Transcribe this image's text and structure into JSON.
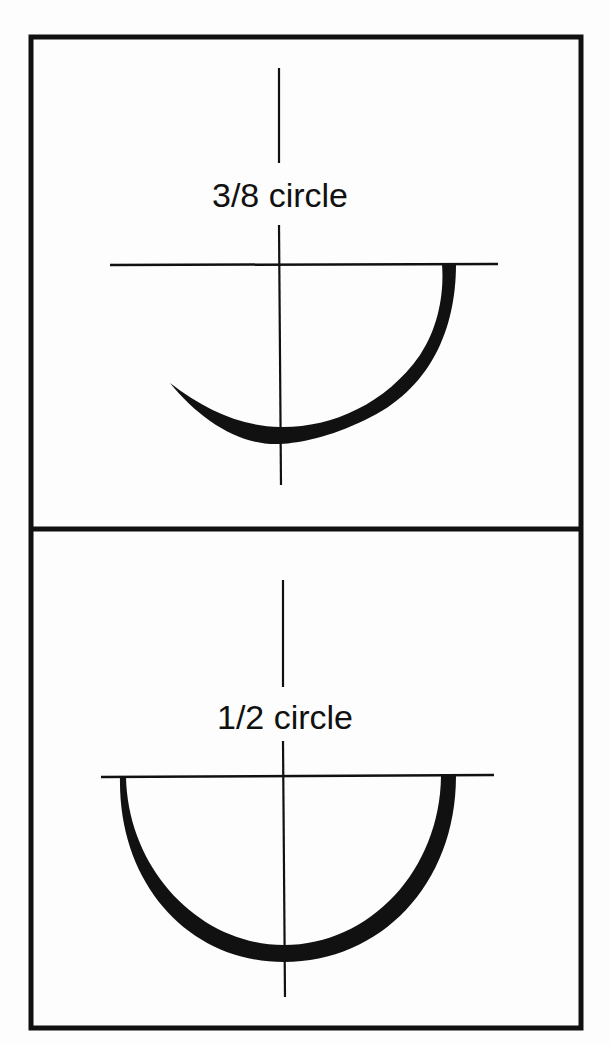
{
  "figure": {
    "panels": [
      {
        "label": "3/8 circle",
        "fraction": "3/8",
        "arc_degrees": 135
      },
      {
        "label": "1/2 circle",
        "fraction": "1/2",
        "arc_degrees": 180
      }
    ],
    "colors": {
      "ink": "#111111",
      "background": "#fdfdfd"
    }
  }
}
